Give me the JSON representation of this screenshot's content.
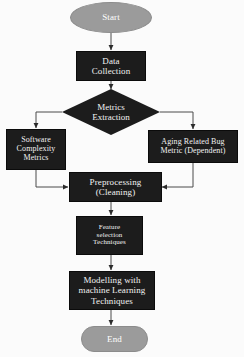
{
  "diagram": {
    "colors": {
      "node_dark": "#1c1c1c",
      "node_gray": "#9b9b9b",
      "node_text": "#f2f2f2",
      "edge": "#4a4a4a",
      "background": "#fbfbfb"
    },
    "nodes": {
      "start": {
        "label": "Start",
        "shape": "ellipse"
      },
      "data_collection": {
        "label": "Data\nCollection",
        "line1": "Data",
        "line2": "Collection",
        "shape": "rectangle"
      },
      "metrics_extraction": {
        "label": "Metrics\nExtraction",
        "line1": "Metrics",
        "line2": "Extraction",
        "shape": "diamond"
      },
      "software_complexity": {
        "line1": "Software",
        "line2": "Complexity",
        "line3": "Metrics",
        "shape": "rectangle"
      },
      "aging_related_bug": {
        "line1": "Aging Related Bug",
        "line2": "Metric (Dependent)",
        "shape": "rectangle"
      },
      "preprocessing": {
        "line1": "Preprocessing",
        "line2": "(Cleaning)",
        "shape": "rectangle"
      },
      "feature_selection": {
        "line1": "Feature",
        "line2": "selection",
        "line3": "Techniques",
        "shape": "rectangle"
      },
      "modelling": {
        "line1": "Modelling with",
        "line2": "machine Learning",
        "line3": "Techniques",
        "shape": "rectangle"
      },
      "end": {
        "label": "End",
        "shape": "stadium"
      }
    },
    "edges": [
      {
        "from": "start",
        "to": "data_collection",
        "style": "straight-down"
      },
      {
        "from": "data_collection",
        "to": "metrics_extraction",
        "style": "straight-down"
      },
      {
        "from": "metrics_extraction",
        "to": "software_complexity",
        "style": "left-branch"
      },
      {
        "from": "metrics_extraction",
        "to": "aging_related_bug",
        "style": "right-branch"
      },
      {
        "from": "software_complexity",
        "to": "preprocessing",
        "style": "left-merge"
      },
      {
        "from": "aging_related_bug",
        "to": "preprocessing",
        "style": "right-merge"
      },
      {
        "from": "preprocessing",
        "to": "feature_selection",
        "style": "straight-down"
      },
      {
        "from": "feature_selection",
        "to": "modelling",
        "style": "straight-down"
      },
      {
        "from": "modelling",
        "to": "end",
        "style": "straight-down"
      }
    ]
  }
}
